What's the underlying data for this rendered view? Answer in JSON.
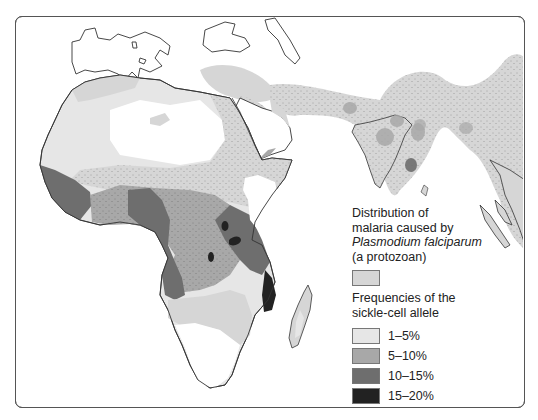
{
  "map": {
    "title": "Distribution of malaria and sickle-cell allele frequencies",
    "regions_shown": [
      "Africa",
      "Southern Europe",
      "Middle East",
      "Indian subcontinent",
      "Southeast Asia"
    ]
  },
  "legend": {
    "malaria": {
      "line1": "Distribution of",
      "line2": "malaria caused by",
      "line3": "Plasmodium falciparum",
      "line4": "(a protozoan)",
      "color": "#d6d6d6",
      "pattern": "stippled"
    },
    "frequency_title_line1": "Frequencies of the",
    "frequency_title_line2": "sickle-cell allele",
    "items": [
      {
        "label": "1–5%",
        "color": "#e6e6e6"
      },
      {
        "label": "5–10%",
        "color": "#a8a8a8"
      },
      {
        "label": "10–15%",
        "color": "#6e6e6e"
      },
      {
        "label": "15–20%",
        "color": "#222222"
      }
    ]
  },
  "colors": {
    "land": "#ffffff",
    "outline": "#333333",
    "malaria": "#d6d6d6",
    "freq_1_5": "#e6e6e6",
    "freq_5_10": "#a8a8a8",
    "freq_10_15": "#6e6e6e",
    "freq_15_20": "#222222"
  }
}
